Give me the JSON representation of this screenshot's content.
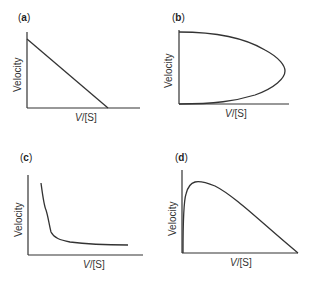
{
  "figure": {
    "panels": [
      {
        "id": "a",
        "label": "a",
        "ylabel": "Velocity",
        "xlabel_italic": "V",
        "xlabel_rest": "/[S]",
        "curve": "linear decreasing"
      },
      {
        "id": "b",
        "label": "b",
        "ylabel": "Velocity",
        "xlabel_italic": "V",
        "xlabel_rest": "/[S]",
        "curve": "parabolic loop (double-valued)"
      },
      {
        "id": "c",
        "label": "c",
        "ylabel": "Velocity",
        "xlabel_italic": "V",
        "xlabel_rest": "/[S]",
        "curve": "hyperbolic decay"
      },
      {
        "id": "d",
        "label": "d",
        "ylabel": "Velocity",
        "xlabel_italic": "V",
        "xlabel_rest": "/[S]",
        "curve": "rise then linear decline"
      }
    ],
    "paren_open": "(",
    "paren_close": ")",
    "line_color": "#333333"
  }
}
